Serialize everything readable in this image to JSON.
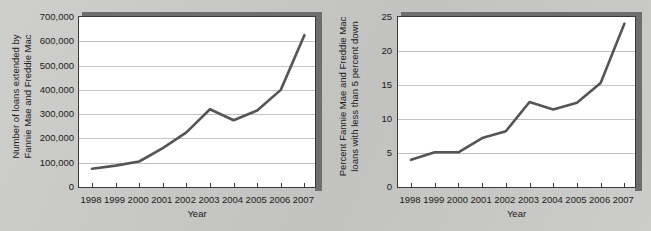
{
  "page": {
    "background_color": "#c9c9c7",
    "line_color": "#555555",
    "frame_color": "#3a3a3a",
    "shadow_color": "#6e6e6e",
    "grid_color": "#c2c2c2",
    "plot_background": "#ffffff"
  },
  "chart_data": [
    {
      "type": "line",
      "title": "",
      "xlabel": "Year",
      "ylabel": "Number of loans extended by Fannie Mae and Freddie Mac",
      "ylabel_lines": [
        "Number of loans extended by",
        "Fannie Mae and Freddie Mac"
      ],
      "categories": [
        "1998",
        "1999",
        "2000",
        "2001",
        "2002",
        "2003",
        "2004",
        "2005",
        "2006",
        "2007"
      ],
      "x": [
        1998,
        1999,
        2000,
        2001,
        2002,
        2003,
        2004,
        2005,
        2006,
        2007
      ],
      "values": [
        75000,
        88000,
        105000,
        160000,
        225000,
        320000,
        275000,
        315000,
        400000,
        625000
      ],
      "ylim": [
        0,
        700000
      ],
      "ytick_values": [
        0,
        100000,
        200000,
        300000,
        400000,
        500000,
        600000,
        700000
      ],
      "ytick_labels": [
        "0",
        "100,000",
        "200,000",
        "300,000",
        "400,000",
        "500,000",
        "600,000",
        "700,000"
      ],
      "grid": true,
      "grid_axis": "y",
      "legend": false,
      "legend_position": "none"
    },
    {
      "type": "line",
      "title": "",
      "xlabel": "Year",
      "ylabel": "Percent Fannie Mae and Freddie Mac loans with less than 5 percent down",
      "ylabel_lines": [
        "Percent Fannie Mae and Freddie Mac",
        "loans with less than 5 percent down"
      ],
      "categories": [
        "1998",
        "1999",
        "2000",
        "2001",
        "2002",
        "2003",
        "2004",
        "2005",
        "2006",
        "2007"
      ],
      "x": [
        1998,
        1999,
        2000,
        2001,
        2002,
        2003,
        2004,
        2005,
        2006,
        2007
      ],
      "values": [
        4.0,
        5.1,
        5.1,
        7.2,
        8.2,
        12.5,
        11.4,
        12.4,
        15.3,
        24.0
      ],
      "ylim": [
        0,
        25
      ],
      "ytick_values": [
        0,
        5,
        10,
        15,
        20,
        25
      ],
      "ytick_labels": [
        "0",
        "5",
        "10",
        "15",
        "20",
        "25"
      ],
      "grid": true,
      "grid_axis": "y",
      "legend": false,
      "legend_position": "none"
    }
  ]
}
